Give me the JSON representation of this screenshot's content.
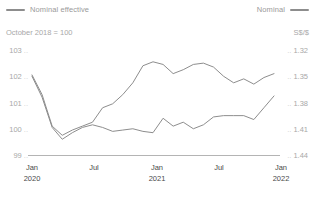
{
  "legend": {
    "left": {
      "label": "Nominal effective",
      "icon": "line-swatch-icon",
      "color": "#8d8d8d"
    },
    "right": {
      "label": "Nominal",
      "icon": "line-swatch-icon",
      "color": "#8d8d8d"
    }
  },
  "units": {
    "left": "October 2018 = 100",
    "right": "S$/$"
  },
  "chart_data": {
    "type": "line",
    "title": "",
    "subtitle": "October 2018 = 100",
    "xlabel": "",
    "ylabel": "October 2018 = 100",
    "y2label": "S$/$",
    "grid": false,
    "legend_position": "top",
    "x_categories": [
      "Jan 2020",
      "Jul",
      "Jan 2021",
      "Jul",
      "Jan 2022"
    ],
    "x_tick_labels": [
      {
        "month": "Jan",
        "year": "2020"
      },
      {
        "month": "Jul",
        "year": ""
      },
      {
        "month": "Jan",
        "year": "2021"
      },
      {
        "month": "Jul",
        "year": ""
      },
      {
        "month": "Jan",
        "year": "2022"
      }
    ],
    "ylim": [
      99,
      103
    ],
    "y_ticks": [
      "103",
      "102",
      "101",
      "100",
      "99"
    ],
    "y2lim": [
      1.44,
      1.3175
    ],
    "y2_ticks": [
      "1.32",
      "1.35",
      "1.38",
      "1.41",
      "1.44"
    ],
    "x": [
      "2020-01",
      "2020-02",
      "2020-03",
      "2020-04",
      "2020-05",
      "2020-06",
      "2020-07",
      "2020-08",
      "2020-09",
      "2020-10",
      "2020-11",
      "2020-12",
      "2021-01",
      "2021-02",
      "2021-03",
      "2021-04",
      "2021-05",
      "2021-06",
      "2021-07",
      "2021-08",
      "2021-09",
      "2021-10",
      "2021-11",
      "2021-12",
      "2022-01"
    ],
    "series": [
      {
        "name": "Nominal",
        "axis": "right",
        "color": "#8d8d8d",
        "values": [
          102.05,
          101.3,
          100.1,
          99.75,
          99.95,
          100.1,
          100.25,
          100.8,
          100.95,
          101.3,
          101.75,
          102.4,
          102.55,
          102.45,
          102.1,
          102.25,
          102.45,
          102.5,
          102.35,
          102.0,
          101.75,
          101.9,
          101.7,
          101.95,
          102.1
        ]
      },
      {
        "name": "Nominal effective",
        "axis": "left",
        "color": "#8d8d8d",
        "values": [
          102.0,
          101.2,
          100.05,
          99.6,
          99.85,
          100.05,
          100.15,
          100.05,
          99.9,
          99.95,
          100.0,
          99.9,
          99.85,
          100.4,
          100.1,
          100.25,
          100.0,
          100.15,
          100.45,
          100.5,
          100.5,
          100.5,
          100.35,
          100.8,
          101.25
        ]
      }
    ]
  }
}
